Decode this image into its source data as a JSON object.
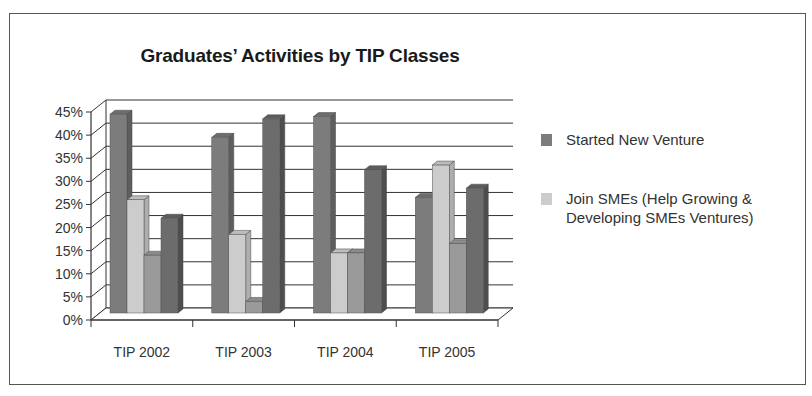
{
  "chart_data": {
    "type": "bar",
    "style": "3d-clustered-column",
    "title": "Graduates’ Activities by TIP Classes",
    "xlabel": "",
    "ylabel": "",
    "ylim": [
      0,
      45
    ],
    "y_ticks": [
      "0%",
      "5%",
      "10%",
      "15%",
      "20%",
      "25%",
      "30%",
      "35%",
      "40%",
      "45%"
    ],
    "categories": [
      "TIP 2002",
      "TIP 2003",
      "TIP 2004",
      "TIP 2005"
    ],
    "grid": true,
    "legend_position": "right",
    "series": [
      {
        "name": "Started New Venture",
        "color": "#7c7c7c",
        "values": [
          43,
          38,
          42.5,
          25
        ]
      },
      {
        "name": "Join SMEs (Help Growing & Developing SMEs Ventures)",
        "color": "#cccccc",
        "values": [
          24.5,
          17,
          13,
          32
        ]
      },
      {
        "name": "",
        "color": "#9a9a9a",
        "values": [
          12.5,
          2.5,
          13,
          15
        ]
      },
      {
        "name": "",
        "color": "#6c6c6c",
        "values": [
          20.5,
          42,
          31,
          27
        ]
      }
    ]
  },
  "legend": {
    "items": [
      {
        "label": "Started New Venture",
        "color": "#7c7c7c"
      },
      {
        "label": "Join SMEs (Help Growing & Developing SMEs Ventures)",
        "color": "#cccccc"
      }
    ]
  }
}
